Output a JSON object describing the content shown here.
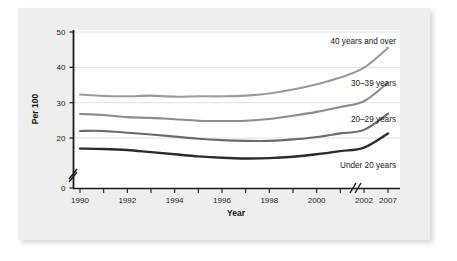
{
  "figure": {
    "background": "#ffffff",
    "panel_color": "#eeeeee",
    "plot_background": "#ffffff"
  },
  "chart_data": {
    "type": "line",
    "title": "",
    "xlabel": "Year",
    "ylabel": "Per 100",
    "xlim": [
      1990,
      2007
    ],
    "ylim": [
      0,
      50
    ],
    "ytick_values": [
      0,
      20,
      30,
      40,
      50
    ],
    "ytick_labels": [
      "0",
      "20",
      "30",
      "40",
      "50"
    ],
    "y_axis_break": true,
    "x_axis_break": true,
    "x_axis_break_between": [
      2002,
      2007
    ],
    "grid": "horizontal",
    "legend_position": "inline-right",
    "xtick_values": [
      1990,
      1991,
      1992,
      1993,
      1994,
      1995,
      1996,
      1997,
      1998,
      1999,
      2000,
      2001,
      2002,
      2007
    ],
    "xtick_labels": [
      "1990",
      "",
      "1992",
      "",
      "1994",
      "",
      "1996",
      "",
      "1998",
      "",
      "2000",
      "",
      "2002",
      "2007"
    ],
    "x": [
      1990,
      1991,
      1992,
      1993,
      1994,
      1995,
      1996,
      1997,
      1998,
      1999,
      2000,
      2001,
      2002,
      2007
    ],
    "series": [
      {
        "name": "40 years and over",
        "label": "40 years and over",
        "color": "#9a9a9a",
        "values": [
          32.3,
          31.9,
          31.8,
          32.0,
          31.7,
          31.8,
          31.8,
          32.0,
          32.6,
          33.7,
          35.2,
          37.1,
          39.9,
          45.5
        ]
      },
      {
        "name": "30-39 years",
        "label": "30–39 years",
        "color": "#8c8c8c",
        "values": [
          26.8,
          26.5,
          25.9,
          25.7,
          25.3,
          24.9,
          24.8,
          24.9,
          25.4,
          26.3,
          27.4,
          28.8,
          30.4,
          35.7
        ]
      },
      {
        "name": "20-29 years",
        "label": "20–29 years",
        "color": "#6a6a6a",
        "values": [
          22.0,
          22.0,
          21.5,
          21.0,
          20.4,
          19.8,
          19.4,
          19.2,
          19.2,
          19.6,
          20.3,
          21.3,
          22.3,
          26.9
        ]
      },
      {
        "name": "Under 20 years",
        "label": "Under 20 years",
        "color": "#2b2b2b",
        "values": [
          17.0,
          16.9,
          16.6,
          16.0,
          15.4,
          14.8,
          14.4,
          14.2,
          14.3,
          14.7,
          15.4,
          16.3,
          17.3,
          21.3
        ]
      }
    ]
  }
}
